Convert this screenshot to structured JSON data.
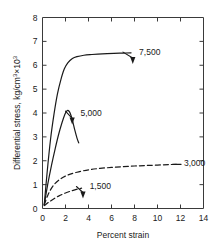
{
  "chart_data": {
    "type": "line",
    "title": "",
    "xlabel": "Percent strain",
    "ylabel": "Differential stress, kg/cm³×10³",
    "ylabel_main": "Differential stress, kg/cm",
    "ylabel_sup1": "3",
    "ylabel_mid": "×10",
    "ylabel_sup2": "3",
    "xlim": [
      0,
      14
    ],
    "ylim": [
      0,
      8
    ],
    "xticks": [
      0,
      2,
      4,
      6,
      8,
      10,
      12,
      14
    ],
    "xtick_labels": [
      "0",
      "2",
      "4",
      "6",
      "8",
      "10",
      "12",
      "14"
    ],
    "yticks": [
      0,
      1,
      2,
      3,
      4,
      5,
      6,
      7,
      8
    ],
    "ytick_labels": [
      "0",
      "1",
      "2",
      "3",
      "4",
      "5",
      "6",
      "7",
      "8"
    ],
    "grid": false,
    "legend_position": "inline-annotations",
    "series": [
      {
        "name": "7,500",
        "label": "7,500",
        "style": "solid",
        "x": [
          0.15,
          0.4,
          0.7,
          1.0,
          1.3,
          1.6,
          1.9,
          2.2,
          2.6,
          3.0,
          3.6,
          4.3,
          5.2,
          6.2,
          7.0,
          7.7
        ],
        "y": [
          0.15,
          1.5,
          2.9,
          3.95,
          4.8,
          5.4,
          5.85,
          6.1,
          6.28,
          6.36,
          6.42,
          6.45,
          6.48,
          6.5,
          6.51,
          6.52
        ],
        "annotation_x": 7.7,
        "annotation_y": 6.52
      },
      {
        "name": "5,000",
        "label": "5,000",
        "style": "solid",
        "x": [
          0.15,
          0.45,
          0.8,
          1.1,
          1.4,
          1.7,
          1.95,
          2.1,
          2.25,
          2.4,
          2.6,
          2.8,
          3.0,
          3.15
        ],
        "y": [
          0.15,
          1.0,
          1.85,
          2.5,
          3.1,
          3.6,
          3.95,
          4.08,
          4.1,
          4.0,
          3.7,
          3.3,
          2.95,
          2.75
        ],
        "annotation_x": 2.45,
        "annotation_y": 3.95
      },
      {
        "name": "3,000",
        "label": "3,000",
        "style": "dashed",
        "x": [
          0.15,
          0.5,
          1.0,
          1.6,
          2.2,
          3.0,
          4.0,
          5.0,
          6.0,
          7.0,
          8.0,
          9.0,
          10.0,
          11.0,
          11.9
        ],
        "y": [
          0.15,
          0.6,
          1.0,
          1.25,
          1.4,
          1.52,
          1.62,
          1.68,
          1.72,
          1.75,
          1.78,
          1.8,
          1.82,
          1.84,
          1.85
        ],
        "annotation_x": 11.9,
        "annotation_y": 1.85
      },
      {
        "name": "1,500",
        "label": "1,500",
        "style": "dashed",
        "x": [
          0.15,
          0.5,
          0.9,
          1.4,
          2.0,
          2.6,
          3.1,
          3.4
        ],
        "y": [
          0.12,
          0.25,
          0.38,
          0.52,
          0.65,
          0.75,
          0.82,
          0.85
        ],
        "annotation_x": 3.4,
        "annotation_y": 0.85
      }
    ],
    "annotations": [
      {
        "label": "7,500",
        "text_x": 8.4,
        "text_y": 6.55
      },
      {
        "label": "5,000",
        "text_x": 3.3,
        "text_y": 4.0
      },
      {
        "label": "3,000",
        "text_x": 12.3,
        "text_y": 1.9
      },
      {
        "label": "1,500",
        "text_x": 4.1,
        "text_y": 0.95
      }
    ],
    "colors": {
      "axis": "#3a3a3a",
      "curve": "#1a1a1a",
      "background": "#ffffff"
    }
  }
}
